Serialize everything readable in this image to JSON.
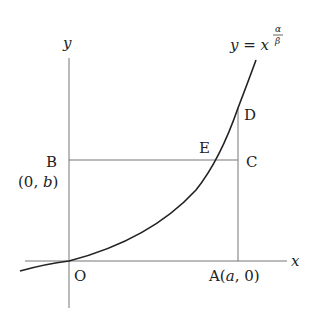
{
  "figure": {
    "function_label": {
      "lhs": "y",
      "eq": " = ",
      "base": "x",
      "exp_num": "α",
      "exp_den": "β"
    },
    "axes": {
      "x_label": "x",
      "y_label": "y",
      "origin_label": "O"
    },
    "points": {
      "A": {
        "name": "A",
        "coords": "(a, 0)",
        "open": "(",
        "var": "a",
        "rest": ", 0)"
      },
      "B": {
        "name": "B",
        "coords": "(0, b)",
        "open": "(0, ",
        "var": "b",
        "close": ")"
      },
      "C": {
        "name": "C"
      },
      "D": {
        "name": "D"
      },
      "E": {
        "name": "E"
      }
    }
  }
}
